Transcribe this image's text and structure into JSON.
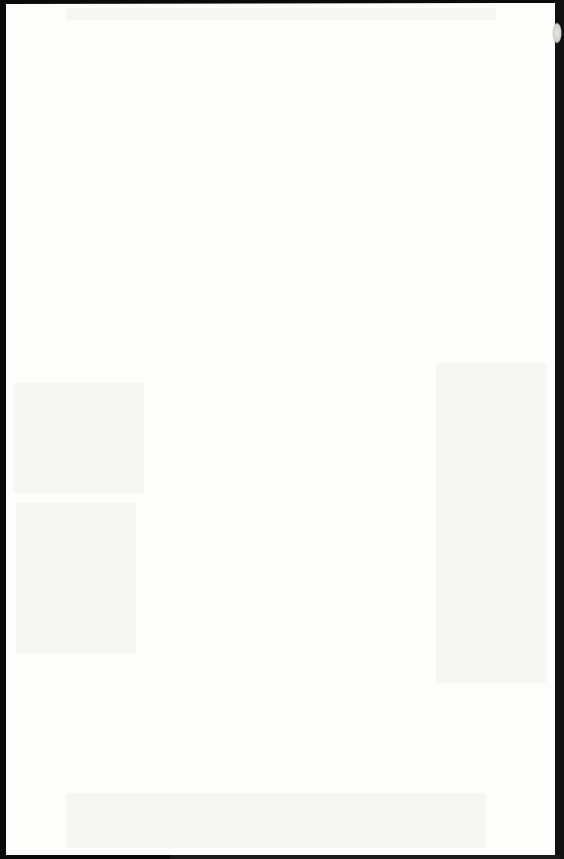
{
  "document": {
    "type": "scanned-page",
    "content": "",
    "note": ""
  },
  "colors": {
    "page": "#fdfdfc",
    "scan_border": "#0a0a0a"
  }
}
